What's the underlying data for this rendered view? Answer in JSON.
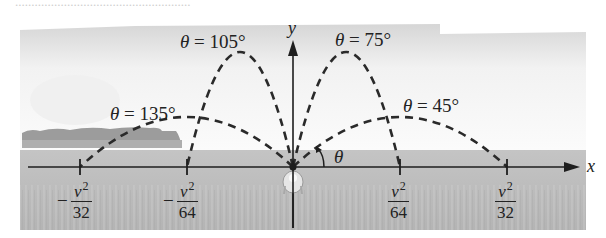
{
  "header": {
    "cut_text": "......................................................"
  },
  "figure": {
    "axes": {
      "x_label": "x",
      "y_label": "y",
      "angle_symbol": "θ"
    },
    "trajectories": [
      {
        "angle": "θ = 135°",
        "range_label": "-v²/32",
        "peak": "low"
      },
      {
        "angle": "θ = 105°",
        "range_label": "-v²/64",
        "peak": "high"
      },
      {
        "angle": "θ = 75°",
        "range_label": "v²/64",
        "peak": "high"
      },
      {
        "angle": "θ = 45°",
        "range_label": "v²/32",
        "peak": "low"
      }
    ],
    "ticks": [
      {
        "sign": "−",
        "num": "v",
        "exp": "2",
        "den": "32"
      },
      {
        "sign": "−",
        "num": "v",
        "exp": "2",
        "den": "64"
      },
      {
        "sign": "",
        "num": "v",
        "exp": "2",
        "den": "64"
      },
      {
        "sign": "",
        "num": "v",
        "exp": "2",
        "den": "32"
      }
    ],
    "colors": {
      "curve": "#2a2a2a",
      "axis": "#1e1e1e",
      "ground": "#b9b9b9",
      "sky_top": "#d8d8d8",
      "shrubs": "#9a9a9a"
    }
  },
  "chart_data": {
    "type": "line",
    "xlabel": "x",
    "ylabel": "y",
    "x_ticks": [
      "-v²/32",
      "-v²/64",
      "0",
      "v²/64",
      "v²/32"
    ],
    "series": [
      {
        "name": "θ = 135°",
        "range": "-v²/32",
        "relative_max_height": 0.5
      },
      {
        "name": "θ = 105°",
        "range": "-v²/64",
        "relative_max_height": 0.93
      },
      {
        "name": "θ = 75°",
        "range": "v²/64",
        "relative_max_height": 0.93
      },
      {
        "name": "θ = 45°",
        "range": "v²/32",
        "relative_max_height": 0.5
      }
    ],
    "style": "dashed parabolas from origin"
  }
}
